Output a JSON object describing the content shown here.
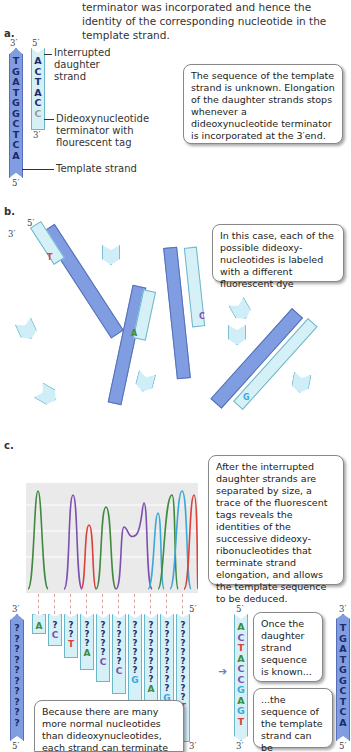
{
  "intro_text": "terminator was incorporated and hence the identity of the corresponding nucleotide in the template strand.",
  "panel_a": {
    "label": "a.",
    "template_top_prime": "3′",
    "template_bottom_prime": "5′",
    "daughter_top_prime": "5′",
    "daughter_bottom_prime": "3′",
    "template_bases": [
      "T",
      "G",
      "A",
      "T",
      "G",
      "G",
      "C",
      "T",
      "C",
      "A"
    ],
    "daughter_bases": [
      "A",
      "C",
      "T",
      "A",
      "C",
      "C"
    ],
    "label_interrupted": "Interrupted daughter strand",
    "label_terminator": "Dideoxynucleotide terminator with flourescent tag",
    "label_template": "Template strand",
    "callout": "The sequence of the template strand is unknown. Elongation of the daughter strands stops whenever a dideoxynucleotide terminator is incorporated at the 3′end."
  },
  "panel_b": {
    "label": "b.",
    "callout": "In this case, each of the possible dideoxy-nucleotides is labeled with a different fluorescent dye",
    "unknown_symbol": "?",
    "terminators": [
      "T",
      "A",
      "C",
      "G"
    ],
    "prime3": "3′",
    "prime5": "5′"
  },
  "panel_c": {
    "label": "c.",
    "callout_trace": "After the interrupted daughter strands are separated by size, a trace of the fluorescent tags reveals the identities of the successive dideoxy-ribonucleotides that terminate strand elongation, and allows the template sequence to be deduced.",
    "callout_because": "Because there are many more normal nucleotides than dideoxynucleotides, each strand can terminate",
    "callout_once": "Once the daughter strand sequence is known...",
    "callout_then": "...the sequence of the template strand can be determined.",
    "fragment_terminators": [
      "A",
      "C",
      "T",
      "A",
      "C",
      "C",
      "G",
      "A",
      "G",
      "T"
    ],
    "daughter_sequence": [
      "A",
      "C",
      "T",
      "A",
      "C",
      "C",
      "G",
      "A",
      "G",
      "T"
    ],
    "template_sequence": [
      "T",
      "G",
      "A",
      "T",
      "G",
      "G",
      "C",
      "T",
      "C",
      "A"
    ],
    "prime3": "3′",
    "prime5": "5′"
  },
  "colors": {
    "A": "#3f8a3f",
    "C": "#7d4fb0",
    "T": "#d9423a",
    "G": "#3aa9d9",
    "template_fill": "#7f9de0",
    "daughter_fill": "#d6f0f8"
  },
  "chart_data": {
    "type": "line",
    "title": "",
    "xlabel": "",
    "ylabel": "",
    "peaks": [
      {
        "base": "A",
        "color": "green",
        "height": 0.95
      },
      {
        "base": "C",
        "color": "purple",
        "height": 0.92
      },
      {
        "base": "T",
        "color": "red",
        "height": 0.66
      },
      {
        "base": "A",
        "color": "green",
        "height": 0.85
      },
      {
        "base": "C",
        "color": "purple",
        "height": 0.62
      },
      {
        "base": "C",
        "color": "purple",
        "height": 0.88
      },
      {
        "base": "G",
        "color": "blue",
        "height": 0.75
      },
      {
        "base": "A",
        "color": "green",
        "height": 0.94
      },
      {
        "base": "G",
        "color": "blue",
        "height": 0.97
      },
      {
        "base": "T",
        "color": "red",
        "height": 0.92
      }
    ],
    "grid": true
  }
}
